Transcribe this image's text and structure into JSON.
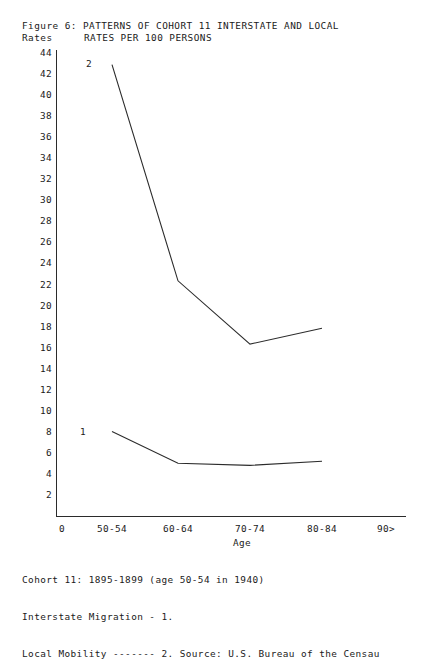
{
  "figure": {
    "title_line1": "Figure 6: PATTERNS OF COHORT 11 INTERSTATE AND LOCAL",
    "title_line2": "RATES PER 100 PERSONS",
    "y_axis_label": "Rates",
    "x_axis_label": "Age"
  },
  "footnotes": {
    "line1": "Cohort 11: 1895-1899 (age 50-54 in 1940)",
    "line2": "Interstate Migration - 1.",
    "line3": "Local Mobility ------- 2. Source: U.S. Bureau of the Censau"
  },
  "markers": {
    "series1": "1",
    "series2": "2"
  },
  "chart_data": {
    "type": "line",
    "title": "Figure 6: PATTERNS OF COHORT 11 INTERSTATE AND LOCAL RATES PER 100 PERSONS",
    "xlabel": "Age",
    "ylabel": "Rates",
    "categories": [
      "50-54",
      "60-64",
      "70-74",
      "80-84"
    ],
    "x_tick_labels": [
      "0",
      "50-54",
      "60-64",
      "70-74",
      "80-84",
      "90>"
    ],
    "y_tick_labels": [
      "44",
      "42",
      "40",
      "38",
      "36",
      "34",
      "32",
      "30",
      "28",
      "26",
      "24",
      "22",
      "20",
      "18",
      "16",
      "14",
      "12",
      "10",
      "8",
      "6",
      "4",
      "2"
    ],
    "ylim": [
      0,
      44
    ],
    "ytick_step": 2,
    "grid": false,
    "legend_position": "inline-marker",
    "series": [
      {
        "name": "Interstate Migration - 1.",
        "marker_label": "1",
        "values": [
          8.0,
          5.0,
          4.8,
          5.2
        ]
      },
      {
        "name": "Local Mobility ------- 2.",
        "marker_label": "2",
        "values": [
          42.8,
          22.3,
          16.3,
          17.8
        ]
      }
    ]
  }
}
